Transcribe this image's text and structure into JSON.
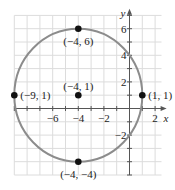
{
  "chart_data": {
    "type": "scatter",
    "title": "",
    "xlabel": "x",
    "ylabel": "y",
    "xlim": [
      -9.5,
      2.5
    ],
    "ylim": [
      -5,
      7
    ],
    "grid": true,
    "x_ticks": [
      -6,
      -4,
      -2,
      2
    ],
    "y_ticks": [
      6,
      4,
      2,
      -2
    ],
    "x_tick_labels": [
      "−6",
      "−4",
      "−2",
      "2"
    ],
    "y_tick_labels": [
      "6",
      "4",
      "2",
      "−2"
    ],
    "curve": {
      "kind": "circle",
      "center": [
        -4,
        1
      ],
      "radius": 5,
      "color": "#8c8c8c"
    },
    "points": [
      {
        "x": -4,
        "y": 6,
        "label": "(−4, 6)"
      },
      {
        "x": -9,
        "y": 1,
        "label": "(−9, 1)"
      },
      {
        "x": -4,
        "y": 1,
        "label": "(−4, 1)"
      },
      {
        "x": 1,
        "y": 1,
        "label": "(1, 1)"
      },
      {
        "x": -4,
        "y": -4,
        "label": "(−4, −4)"
      }
    ],
    "colors": {
      "grid": "#dcdcdc",
      "axis": "#555555",
      "point": "#111111"
    }
  }
}
